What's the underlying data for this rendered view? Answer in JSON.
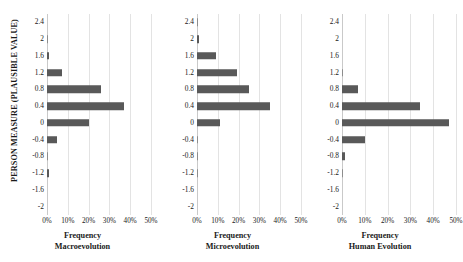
{
  "figure": {
    "y_axis_title": "PERSON MEASURE (PLAUSIBLE VALUE)",
    "bar_color": "#595959",
    "gridline_color": "#e3e3e3"
  },
  "chart_data": [
    {
      "type": "bar",
      "orientation": "horizontal",
      "title": "",
      "xlabel": "Frequency",
      "sublabel": "Macroevolution",
      "ylabel": "PERSON MEASURE (PLAUSIBLE VALUE)",
      "categories": [
        "2.4",
        "2",
        "1.6",
        "1.2",
        "0.8",
        "0.4",
        "0",
        "-0.4",
        "-0.8",
        "-1.2",
        "-1.6",
        "-2"
      ],
      "values": [
        0,
        0.4,
        1.2,
        7,
        26,
        37,
        20,
        5,
        0.4,
        1.2,
        0,
        0
      ],
      "xlim": [
        0,
        50
      ],
      "xticks": [
        "0%",
        "10%",
        "20%",
        "30%",
        "40%",
        "50%"
      ],
      "xtick_values": [
        0,
        10,
        20,
        30,
        40,
        50
      ],
      "grid": true,
      "legend": "none"
    },
    {
      "type": "bar",
      "orientation": "horizontal",
      "title": "",
      "xlabel": "Frequency",
      "sublabel": "Microevolution",
      "ylabel": "PERSON MEASURE (PLAUSIBLE VALUE)",
      "categories": [
        "2.4",
        "2",
        "1.6",
        "1.2",
        "0.8",
        "0.4",
        "0",
        "-0.4",
        "-0.8",
        "-1.2",
        "-1.6",
        "-2"
      ],
      "values": [
        0.4,
        1.2,
        9,
        19,
        25,
        35,
        11,
        0.4,
        0.4,
        0.4,
        0,
        0
      ],
      "xlim": [
        0,
        50
      ],
      "xticks": [
        "0%",
        "10%",
        "20%",
        "30%",
        "40%",
        "50%"
      ],
      "xtick_values": [
        0,
        10,
        20,
        30,
        40,
        50
      ],
      "grid": true,
      "legend": "none"
    },
    {
      "type": "bar",
      "orientation": "horizontal",
      "title": "",
      "xlabel": "Frequency",
      "sublabel": "Human Evolution",
      "ylabel": "PERSON MEASURE (PLAUSIBLE VALUE)",
      "categories": [
        "2.4",
        "2",
        "1.6",
        "1.2",
        "0.8",
        "0.4",
        "0",
        "-0.4",
        "-0.8",
        "-1.2",
        "-1.6",
        "-2"
      ],
      "values": [
        0,
        0,
        0,
        0.4,
        7,
        34,
        47,
        10,
        1.2,
        0.4,
        0,
        0
      ],
      "xlim": [
        0,
        50
      ],
      "xticks": [
        "0%",
        "10%",
        "20%",
        "30%",
        "40%",
        "50%"
      ],
      "xtick_values": [
        0,
        10,
        20,
        30,
        40,
        50
      ],
      "grid": true,
      "legend": "none"
    }
  ],
  "panels": [
    {
      "id": "macroevolution",
      "xlabel": "Frequency",
      "sublabel": "Macroevolution"
    },
    {
      "id": "microevolution",
      "xlabel": "Frequency",
      "sublabel": "Microevolution"
    },
    {
      "id": "human-evolution",
      "xlabel": "Frequency",
      "sublabel": "Human Evolution"
    }
  ]
}
